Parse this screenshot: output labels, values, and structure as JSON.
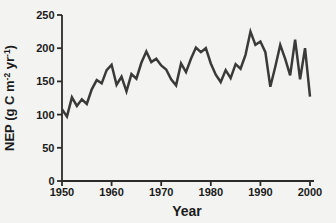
{
  "figure": {
    "background": "#f3f3f1",
    "line_color": "#3a3a3a",
    "axis_color": "#2b2b2b",
    "text_color": "#1b1b1b"
  },
  "chart_data": {
    "type": "line",
    "title": "",
    "xlabel": "Year",
    "ylabel": "NEP (g C m⁻² yr⁻¹)",
    "ylabel_parts": [
      {
        "t": "NEP (g C m",
        "sup": false
      },
      {
        "t": "-2",
        "sup": true
      },
      {
        "t": " yr",
        "sup": false
      },
      {
        "t": "-1",
        "sup": true
      },
      {
        "t": ")",
        "sup": false
      }
    ],
    "xlim": [
      1950,
      2000
    ],
    "ylim": [
      0,
      250
    ],
    "x_ticks": [
      1950,
      1960,
      1970,
      1980,
      1990,
      2000
    ],
    "y_ticks": [
      0,
      50,
      100,
      150,
      200,
      250
    ],
    "grid": false,
    "legend": false,
    "x": [
      1950,
      1951,
      1952,
      1953,
      1954,
      1955,
      1956,
      1957,
      1958,
      1959,
      1960,
      1961,
      1962,
      1963,
      1964,
      1965,
      1966,
      1967,
      1968,
      1969,
      1970,
      1971,
      1972,
      1973,
      1974,
      1975,
      1976,
      1977,
      1978,
      1979,
      1980,
      1981,
      1982,
      1983,
      1984,
      1985,
      1986,
      1987,
      1988,
      1989,
      1990,
      1991,
      1992,
      1993,
      1994,
      1995,
      1996,
      1997,
      1998,
      1999,
      2000
    ],
    "values": [
      108,
      97,
      126,
      113,
      123,
      116,
      138,
      152,
      147,
      167,
      175,
      145,
      157,
      135,
      161,
      154,
      178,
      195,
      179,
      184,
      174,
      168,
      153,
      144,
      177,
      164,
      184,
      201,
      194,
      200,
      177,
      160,
      149,
      167,
      155,
      176,
      169,
      190,
      225,
      205,
      210,
      194,
      142,
      172,
      205,
      184,
      159,
      213,
      153,
      200,
      127
    ]
  }
}
